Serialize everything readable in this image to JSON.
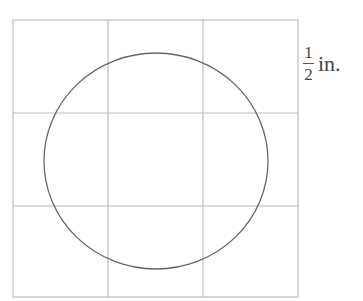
{
  "diagram": {
    "grid": {
      "rows": 3,
      "cols": 3,
      "line_color": "#bdbdbd"
    },
    "shape": {
      "type": "circle",
      "stroke_color": "#666666"
    },
    "scale_label": {
      "numerator": "1",
      "denominator": "2",
      "unit": "in."
    }
  }
}
